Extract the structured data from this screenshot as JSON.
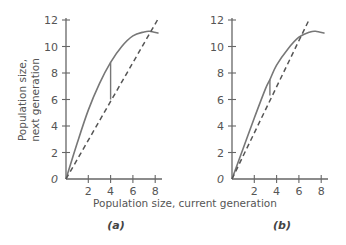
{
  "chart_data": [
    {
      "type": "line",
      "panel": "(a)",
      "xlabel": "Population size, current generation",
      "ylabel": "Population size, next generation",
      "xlim": [
        0,
        8.5
      ],
      "ylim": [
        0,
        12
      ],
      "xticks": [
        2,
        4,
        6,
        8
      ],
      "yticks": [
        0,
        2,
        4,
        6,
        8,
        10,
        12
      ],
      "series": [
        {
          "name": "recruitment curve",
          "style": "solid",
          "x": [
            0,
            1,
            2,
            3,
            4,
            5,
            6,
            7,
            7.5,
            8.3
          ],
          "y": [
            0,
            2.7,
            5.2,
            7.2,
            8.8,
            10.0,
            10.8,
            11.1,
            11.15,
            11.0
          ]
        },
        {
          "name": "replacement line (next = current)",
          "style": "dashed",
          "x": [
            0,
            8.2
          ],
          "y": [
            0,
            12
          ]
        },
        {
          "name": "vertical segment",
          "style": "solid",
          "x": [
            4,
            4
          ],
          "y": [
            6,
            8.8
          ]
        }
      ],
      "annotations": [
        "Curve crosses dashed line near x≈7.6, y≈11.2"
      ]
    },
    {
      "type": "line",
      "panel": "(b)",
      "xlabel": "Population size, current generation",
      "ylabel": "Population size, next generation",
      "xlim": [
        0,
        8.5
      ],
      "ylim": [
        0,
        12
      ],
      "xticks": [
        2,
        4,
        6,
        8
      ],
      "yticks": [
        0,
        2,
        4,
        6,
        8,
        10,
        12
      ],
      "series": [
        {
          "name": "recruitment curve",
          "style": "solid",
          "x": [
            0,
            1,
            2,
            3,
            3.4,
            4,
            5,
            6,
            7,
            7.5,
            8.3
          ],
          "y": [
            0,
            2.3,
            4.6,
            6.8,
            7.5,
            8.6,
            9.8,
            10.7,
            11.1,
            11.15,
            11.0
          ]
        },
        {
          "name": "replacement line (next = current)",
          "style": "dashed",
          "x": [
            0,
            6.9
          ],
          "y": [
            0,
            12
          ]
        },
        {
          "name": "vertical segment",
          "style": "solid",
          "x": [
            3.4,
            3.4
          ],
          "y": [
            6.3,
            7.5
          ]
        }
      ],
      "annotations": [
        "Curve crosses dashed line near x≈6, y≈10.5"
      ]
    }
  ],
  "labels": {
    "y_axis_line1": "Population size,",
    "y_axis_line2": "next generation",
    "x_axis": "Population size, current generation",
    "panel_a": "(a)",
    "panel_b": "(b)",
    "y_ticks": [
      "0",
      "2",
      "4",
      "6",
      "8",
      "10",
      "12"
    ],
    "x_ticks": [
      "2",
      "4",
      "6",
      "8"
    ]
  },
  "colors": {
    "axis": "#666666",
    "curve": "#777777",
    "text": "#555555"
  }
}
